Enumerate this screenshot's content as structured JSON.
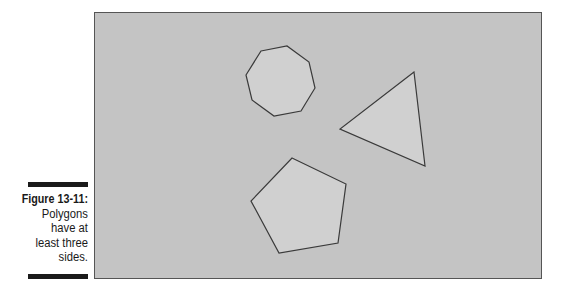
{
  "figure": {
    "label": "Figure 13-11:",
    "caption": "Polygons have at least three sides.",
    "caption_lines": [
      "Polygons",
      "have at",
      "least three",
      "sides."
    ]
  },
  "canvas": {
    "background": "#c4c4c4",
    "border": "#555555",
    "shape_fill": "#d0d0d0",
    "shape_stroke": "#3a3a3a"
  },
  "shapes": [
    {
      "name": "octagon",
      "sides": 8,
      "points": "260,50 286,45 308,61 314,87 300,110 273,115 251,99 245,74"
    },
    {
      "name": "triangle",
      "sides": 3,
      "points": "413,71 339,128 424,165"
    },
    {
      "name": "pentagon",
      "sides": 5,
      "points": "291,157 345,183 337,242 278,252 250,200"
    }
  ]
}
